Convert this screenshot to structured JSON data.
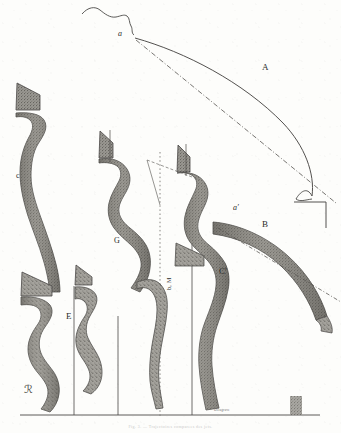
{
  "plate": {
    "kind": "engraved-scientific-plate",
    "background_color": "#fdfdfb",
    "ink_color": "#3a3a38",
    "band_fill_color": "#8c8a84",
    "band_edge_color": "#4a4846",
    "width": 341,
    "height": 433
  },
  "labels": [
    {
      "id": "a",
      "text": "a",
      "x": 118,
      "y": 29,
      "style": "italic-minuscule"
    },
    {
      "id": "A",
      "text": "A",
      "x": 262,
      "y": 69,
      "style": "roman-capital"
    },
    {
      "id": "c",
      "text": "c",
      "x": 16,
      "y": 177,
      "style": "roman-minuscule"
    },
    {
      "id": "a-prime",
      "text": "a′",
      "x": 233,
      "y": 209,
      "style": "italic-minuscule-prime"
    },
    {
      "id": "B",
      "text": "B",
      "x": 262,
      "y": 226,
      "style": "roman-capital"
    },
    {
      "id": "G",
      "text": "G",
      "x": 114,
      "y": 242,
      "style": "roman-capital"
    },
    {
      "id": "C-prime",
      "text": "C′",
      "x": 219,
      "y": 273,
      "style": "roman-capital-prime"
    },
    {
      "id": "E",
      "text": "E",
      "x": 66,
      "y": 318,
      "style": "roman-capital"
    }
  ],
  "rotated_label": {
    "id": "b-M",
    "text": "b, M",
    "x": 166,
    "y": 290
  },
  "signatures": {
    "monogram": {
      "id": "artist-monogram",
      "text": "ℛ",
      "x": 24,
      "y": 389
    },
    "engraver": {
      "id": "engraver-credit",
      "text": "Delagrave",
      "x": 214,
      "y": 410
    }
  },
  "caption": {
    "text": "Fig. 3. — Trajectoires comparees des jets.",
    "visible": "faint"
  },
  "figures": [
    {
      "id": "band-c",
      "label": "c",
      "group": "left",
      "vertical_rule_x": 74
    },
    {
      "id": "band-E",
      "label": "E",
      "group": "left-low",
      "vertical_rule_x": 118
    },
    {
      "id": "band-G",
      "label": "G",
      "group": "middle",
      "vertical_rule_x": 160
    },
    {
      "id": "band-Cp",
      "label": "C′",
      "group": "right",
      "vertical_rule_x": 192
    },
    {
      "id": "band-B",
      "label": "B",
      "group": "right-arc",
      "vertical_rule_x": 0
    }
  ],
  "construction_lines": {
    "ground_line_y": 415,
    "dash_dot_from": "a",
    "dash_dot_to": "corner-bracket",
    "corner_bracket": {
      "x": 300,
      "y": 202,
      "arm": 32
    }
  }
}
